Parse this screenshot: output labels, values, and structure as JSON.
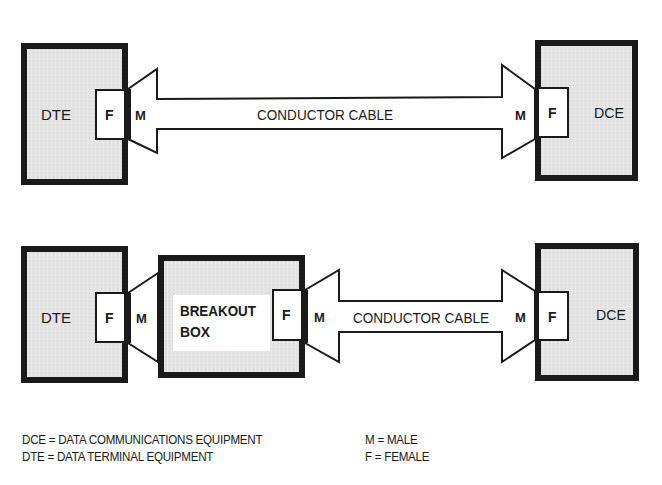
{
  "diagram": {
    "top": {
      "dte_label": "DTE",
      "dte_connector": "F",
      "cable_left_end": "M",
      "cable_label": "CONDUCTOR CABLE",
      "cable_right_end": "M",
      "dce_connector": "F",
      "dce_label": "DCE"
    },
    "bottom": {
      "dte_label": "DTE",
      "dte_connector": "F",
      "breakout_left_end": "M",
      "breakout_label_line1": "BREAKOUT",
      "breakout_label_line2": "BOX",
      "breakout_connector": "F",
      "cable_left_end": "M",
      "cable_label": "CONDUCTOR CABLE",
      "cable_right_end": "M",
      "dce_connector": "F",
      "dce_label": "DCE"
    }
  },
  "legend": {
    "definitions": [
      {
        "term": "DCE",
        "eq": "=",
        "meaning": "DATA COMMUNICATIONS EQUIPMENT"
      },
      {
        "term": "DTE",
        "eq": "=",
        "meaning": "DATA TERMINAL EQUIPMENT"
      }
    ],
    "genders": [
      {
        "term": "M",
        "eq": "=",
        "meaning": "MALE"
      },
      {
        "term": "F",
        "eq": "=",
        "meaning": "FEMALE"
      }
    ]
  },
  "colors": {
    "box_fill": "#e6e6e6",
    "outline": "#1a1a1a",
    "background": "#ffffff"
  }
}
